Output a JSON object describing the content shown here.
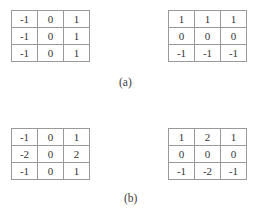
{
  "figure": {
    "title_visible": false,
    "background_color": "#ffffff",
    "border_color": "#9a9a9a",
    "text_color": "#333333",
    "panels": [
      {
        "caption": "(a)",
        "kernels": [
          {
            "name": "prewitt-horizontal-gradient",
            "rows": [
              [
                "-1",
                "0",
                "1"
              ],
              [
                "-1",
                "0",
                "1"
              ],
              [
                "-1",
                "0",
                "1"
              ]
            ]
          },
          {
            "name": "prewitt-vertical-gradient",
            "rows": [
              [
                "1",
                "1",
                "1"
              ],
              [
                "0",
                "0",
                "0"
              ],
              [
                "-1",
                "-1",
                "-1"
              ]
            ]
          }
        ]
      },
      {
        "caption": "(b)",
        "kernels": [
          {
            "name": "sobel-horizontal-gradient",
            "rows": [
              [
                "-1",
                "0",
                "1"
              ],
              [
                "-2",
                "0",
                "2"
              ],
              [
                "-1",
                "0",
                "1"
              ]
            ]
          },
          {
            "name": "sobel-vertical-gradient",
            "rows": [
              [
                "1",
                "2",
                "1"
              ],
              [
                "0",
                "0",
                "0"
              ],
              [
                "-1",
                "-2",
                "-1"
              ]
            ]
          }
        ]
      }
    ]
  },
  "chart_data": {
    "type": "table",
    "title": "",
    "xlabel": "",
    "ylabel": "",
    "matrices": [
      {
        "label": "(a) left",
        "values": [
          [
            -1,
            0,
            1
          ],
          [
            -1,
            0,
            1
          ],
          [
            -1,
            0,
            1
          ]
        ]
      },
      {
        "label": "(a) right",
        "values": [
          [
            1,
            1,
            1
          ],
          [
            0,
            0,
            0
          ],
          [
            -1,
            -1,
            -1
          ]
        ]
      },
      {
        "label": "(b) left",
        "values": [
          [
            -1,
            0,
            1
          ],
          [
            -2,
            0,
            2
          ],
          [
            -1,
            0,
            1
          ]
        ]
      },
      {
        "label": "(b) right",
        "values": [
          [
            1,
            2,
            1
          ],
          [
            0,
            0,
            0
          ],
          [
            -1,
            -2,
            -1
          ]
        ]
      }
    ]
  }
}
